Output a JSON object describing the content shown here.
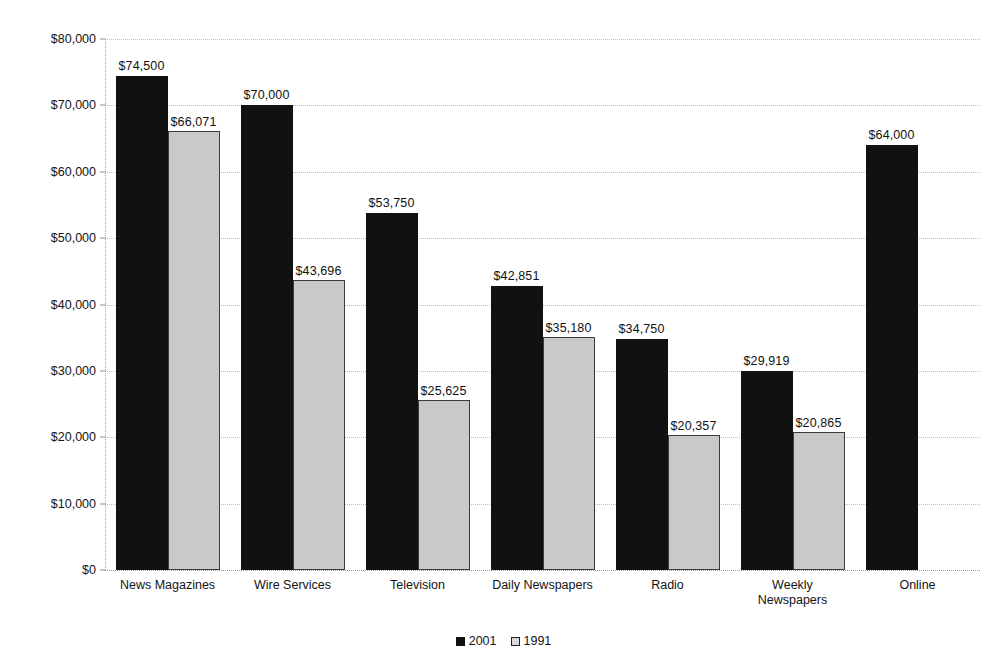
{
  "chart_data": {
    "type": "bar",
    "title": "",
    "subtitle": "",
    "xlabel": "",
    "ylabel": "",
    "ylim": [
      0,
      80000
    ],
    "ytick_values": [
      0,
      10000,
      20000,
      30000,
      40000,
      50000,
      60000,
      70000,
      80000
    ],
    "ytick_labels": [
      "$0",
      "$10,000",
      "$20,000",
      "$30,000",
      "$40,000",
      "$50,000",
      "$60,000",
      "$70,000",
      "$80,000"
    ],
    "grid": true,
    "legend_position": "bottom-center",
    "categories": [
      "News Magazines",
      "Wire Services",
      "Television",
      "Daily Newspapers",
      "Radio",
      "Weekly\nNewspapers",
      "Online"
    ],
    "series": [
      {
        "name": "2001",
        "color": "#111111",
        "values": [
          74500,
          70000,
          53750,
          42851,
          34750,
          29919,
          64000
        ],
        "labels": [
          "$74,500",
          "$70,000",
          "$53,750",
          "$42,851",
          "$34,750",
          "$29,919",
          "$64,000"
        ]
      },
      {
        "name": "1991",
        "color": "#c9c9c9",
        "values": [
          66071,
          43696,
          25625,
          35180,
          20357,
          20865,
          null
        ],
        "labels": [
          "$66,071",
          "$43,696",
          "$25,625",
          "$35,180",
          "$20,357",
          "$20,865",
          null
        ]
      }
    ]
  },
  "legend": {
    "items": [
      {
        "label": "2001",
        "swatch": "filled"
      },
      {
        "label": "1991",
        "swatch": "hollow"
      }
    ]
  }
}
